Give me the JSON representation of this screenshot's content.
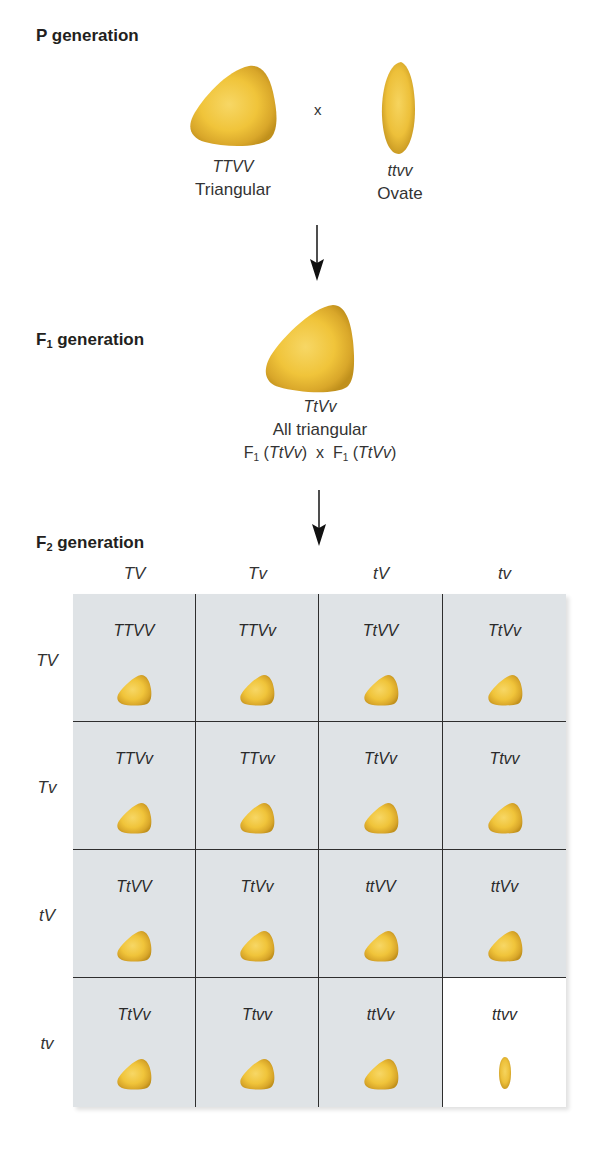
{
  "p_generation": {
    "label": "P generation",
    "parent1": {
      "genotype": "TTVV",
      "phenotype": "Triangular",
      "shape": "triangular-seed"
    },
    "cross_symbol": "x",
    "parent2": {
      "genotype": "ttvv",
      "phenotype": "Ovate",
      "shape": "ovate-seed"
    }
  },
  "f1_generation": {
    "label_prefix": "F",
    "label_sub": "1",
    "label_suffix": " generation",
    "genotype": "TtVv",
    "phenotype": "All triangular",
    "cross": {
      "left_prefix": "F",
      "left_sub": "1",
      "left_geno": "TtVv",
      "symbol": "x",
      "right_prefix": "F",
      "right_sub": "1",
      "right_geno": "TtVv"
    }
  },
  "f2_generation": {
    "label_prefix": "F",
    "label_sub": "2",
    "label_suffix": " generation",
    "column_gametes": [
      "TV",
      "Tv",
      "tV",
      "tv"
    ],
    "row_gametes": [
      "TV",
      "Tv",
      "tV",
      "tv"
    ],
    "cells": [
      [
        {
          "g": "TTVV",
          "shape": "triangular"
        },
        {
          "g": "TTVv",
          "shape": "triangular"
        },
        {
          "g": "TtVV",
          "shape": "triangular"
        },
        {
          "g": "TtVv",
          "shape": "triangular"
        }
      ],
      [
        {
          "g": "TTVv",
          "shape": "triangular"
        },
        {
          "g": "TTvv",
          "shape": "triangular"
        },
        {
          "g": "TtVv",
          "shape": "triangular"
        },
        {
          "g": "Ttvv",
          "shape": "triangular"
        }
      ],
      [
        {
          "g": "TtVV",
          "shape": "triangular"
        },
        {
          "g": "TtVv",
          "shape": "triangular"
        },
        {
          "g": "ttVV",
          "shape": "triangular"
        },
        {
          "g": "ttVv",
          "shape": "triangular"
        }
      ],
      [
        {
          "g": "TtVv",
          "shape": "triangular"
        },
        {
          "g": "Ttvv",
          "shape": "triangular"
        },
        {
          "g": "ttVv",
          "shape": "triangular"
        },
        {
          "g": "ttvv",
          "shape": "ovate"
        }
      ]
    ]
  },
  "colors": {
    "seed_fill": "#f2c53d",
    "seed_edge": "#c9981c",
    "cell_bg": "#dfe3e6",
    "cell_bg_recessive": "#ffffff",
    "grid_line": "#2e2e2e",
    "text": "#231f20"
  }
}
